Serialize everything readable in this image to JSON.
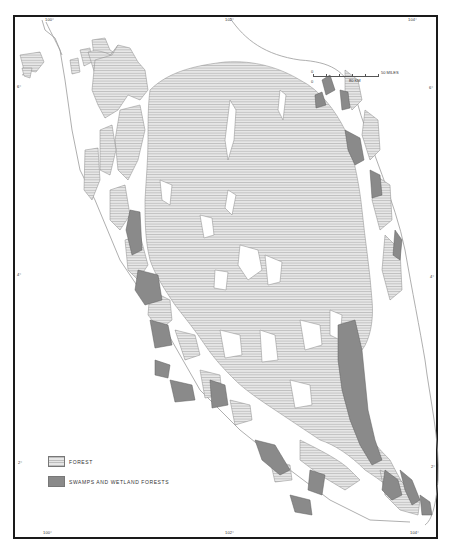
{
  "map": {
    "title": "",
    "frame": {
      "border_color": "#1a1a1a"
    },
    "colors": {
      "forest_hatch": "#bdbdbd",
      "forest_bg": "#e6e6e6",
      "swamp": "#8a8a8a",
      "outline": "#777777",
      "coast": "#999999"
    },
    "graticule": {
      "top_labels": [
        {
          "text": "100°",
          "x": 45,
          "y": 19
        },
        {
          "text": "102°",
          "x": 225,
          "y": 19
        },
        {
          "text": "104°",
          "x": 410,
          "y": 19
        }
      ],
      "bottom_labels": [
        {
          "text": "100°",
          "x": 43,
          "y": 533
        },
        {
          "text": "102°",
          "x": 225,
          "y": 533
        },
        {
          "text": "104°",
          "x": 411,
          "y": 533
        }
      ],
      "left_labels": [
        {
          "text": "6°",
          "x": 16,
          "y": 86
        },
        {
          "text": "4°",
          "x": 17,
          "y": 274
        },
        {
          "text": "2°",
          "x": 18,
          "y": 462
        }
      ],
      "right_labels": [
        {
          "text": "6°",
          "x": 430,
          "y": 87
        },
        {
          "text": "4°",
          "x": 431,
          "y": 276
        },
        {
          "text": "2°",
          "x": 432,
          "y": 466
        }
      ]
    },
    "scale_bar": {
      "miles_zero": "0",
      "miles_label": "50 MILES",
      "km_zero": "0",
      "km_label": "80 KM"
    },
    "legend": {
      "items": [
        {
          "label": "FOREST",
          "type": "forest"
        },
        {
          "label": "SWAMPS AND WETLAND FORESTS",
          "type": "swamp"
        }
      ]
    }
  }
}
